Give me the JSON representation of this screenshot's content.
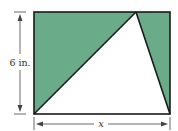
{
  "diagram": {
    "height_label": "6 in.",
    "width_label": "x",
    "colors": {
      "shaded": "#6aab8a",
      "stroke": "#1a1a1a",
      "dimension": "#444444"
    }
  }
}
